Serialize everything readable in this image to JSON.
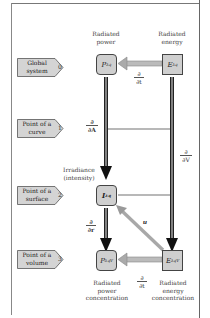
{
  "levels": [
    {
      "label": "Global system",
      "number": "0"
    },
    {
      "label": "Point of a curve",
      "number": "1"
    },
    {
      "label": "Point of a surface",
      "number": "2"
    },
    {
      "label": "Point of a volume",
      "number": "3"
    }
  ],
  "quantities": {
    "power": {
      "caption": "Radiated power",
      "symbol": "P",
      "subscript": "λq"
    },
    "energy": {
      "caption": "Radiated energy",
      "symbol": "E",
      "subscript": "λq"
    },
    "irradiance": {
      "caption": "Irradiance (intensity)",
      "symbol": "I",
      "subscript": "λq"
    },
    "power_conc": {
      "caption": "Radiated power concentration",
      "symbol": "P",
      "subscript": "λqV"
    },
    "energy_conc": {
      "caption": "Radiated energy concentration",
      "symbol": "E",
      "subscript": "λqV"
    }
  },
  "operators": {
    "time_top": {
      "num": "∂",
      "den": "∂t"
    },
    "area": {
      "num": "∂",
      "den": "∂A"
    },
    "volume": {
      "num": "∂",
      "den": "∂V"
    },
    "radius": {
      "num": "∂",
      "den": "∂r"
    },
    "time_bottom": {
      "num": "∂",
      "den": "∂t"
    },
    "velocity": "u"
  },
  "colors": {
    "box_fill": "#cfcfcf",
    "box_border": "#444444",
    "tag_fill": "#d4d4d4",
    "dark_line": "#222222",
    "light_arrow": "#a8a8a8"
  }
}
